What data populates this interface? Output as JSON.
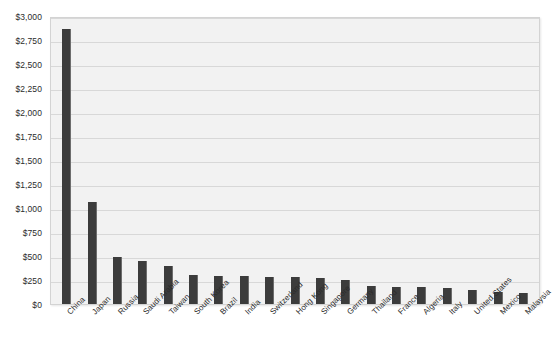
{
  "chart_data": {
    "type": "bar",
    "title": "",
    "subtitle": "",
    "xlabel": "",
    "ylabel": "",
    "categories": [
      "China",
      "Japan",
      "Russia",
      "Saudi Arabia",
      "Taiwan",
      "South Korea",
      "Brazil",
      "India",
      "Switzerland",
      "Hong Kong",
      "Singapore",
      "Germany",
      "Thailand",
      "France",
      "Algeria",
      "Italy",
      "United States",
      "Mexico",
      "Malaysia"
    ],
    "values": [
      2865,
      1060,
      490,
      450,
      400,
      300,
      295,
      290,
      285,
      280,
      275,
      250,
      185,
      180,
      175,
      170,
      150,
      130,
      115
    ],
    "ylim": [
      0,
      3000
    ],
    "ytick_values": [
      0,
      250,
      500,
      750,
      1000,
      1250,
      1500,
      1750,
      2000,
      2250,
      2500,
      2750,
      3000
    ],
    "ytick_labels": [
      "$0",
      "$250",
      "$500",
      "$750",
      "$1,000",
      "$1,250",
      "$1,500",
      "$1,750",
      "$2,000",
      "$2,250",
      "$2,500",
      "$2,750",
      "$3,000"
    ],
    "grid": true,
    "legend": false,
    "legend_position": "none",
    "colors": {
      "bar": "#3c3c3c",
      "plot_background": "#f2f2f2",
      "gridline": "#d8d8d8",
      "plot_border": "#d3d3d3",
      "text": "#2b2b2b",
      "page_background": "#ffffff"
    }
  }
}
